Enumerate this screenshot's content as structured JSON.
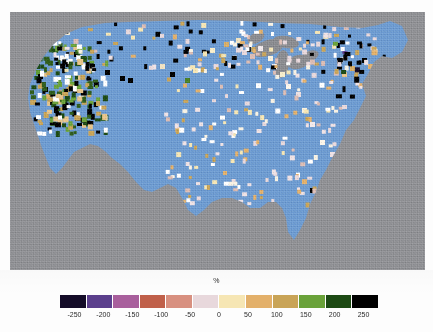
{
  "figure": {
    "kind": "choropleth-map-with-colorbar",
    "background_color": "#fdfdfd"
  },
  "map": {
    "title": "",
    "region": "Contiguous United States",
    "land_color": "#6d9bd1",
    "outside_color": "#8f9094",
    "panel": {
      "x": 10,
      "y": 12,
      "width": 415,
      "height": 258
    }
  },
  "colorbar": {
    "title": "%",
    "orientation": "horizontal",
    "vmin": -250,
    "vmax": 250,
    "tick_labels": [
      "-250",
      "-200",
      "-150",
      "-100",
      "-50",
      "0",
      "50",
      "100",
      "150",
      "200",
      "250"
    ],
    "tick_values": [
      -250,
      -200,
      -150,
      -100,
      -50,
      0,
      50,
      100,
      150,
      200,
      250
    ],
    "segment_colors": [
      "#140c28",
      "#5b3f8c",
      "#a85f9c",
      "#c0604a",
      "#d89080",
      "#e8d8dc",
      "#f6e6b4",
      "#e3b06a",
      "#c9a457",
      "#6aa23a",
      "#1d4a14",
      "#000000"
    ],
    "segment_labels": [
      "<= -250",
      "-250 to -200",
      "-200 to -150",
      "-150 to -100",
      "-100 to -50",
      "-50 to 0",
      "0 to 50",
      "50 to 100",
      "100 to 150",
      "150 to 200",
      "200 to 250",
      ">= 250"
    ]
  },
  "chart_data": {
    "type": "heatmap",
    "title": "",
    "xlabel": "",
    "ylabel": "",
    "colorbar_label": "%",
    "vmin": -250,
    "vmax": 250,
    "legend_position": "bottom",
    "grid": false,
    "cells": [
      {
        "x": 40,
        "y": 14,
        "value": 250,
        "color": "#000000"
      },
      {
        "x": 35,
        "y": 11,
        "value": 180,
        "color": "#2f5c1c"
      },
      {
        "x": 31,
        "y": 14,
        "value": 120,
        "color": "#c9a457"
      },
      {
        "x": 27,
        "y": 16,
        "value": 240,
        "color": "#0d2a0a"
      },
      {
        "x": 52,
        "y": 12,
        "value": 60,
        "color": "#efe2c0"
      },
      {
        "x": 55,
        "y": 18,
        "value": 30,
        "color": "#f6eed8"
      },
      {
        "x": 61,
        "y": 12,
        "value": 250,
        "color": "#000000"
      },
      {
        "x": 30,
        "y": 25,
        "value": 250,
        "color": "#000000"
      },
      {
        "x": 24,
        "y": 29,
        "value": 250,
        "color": "#000000"
      },
      {
        "x": 23,
        "y": 45,
        "value": 250,
        "color": "#000000"
      },
      {
        "x": 25,
        "y": 52,
        "value": 200,
        "color": "#1d4a14"
      },
      {
        "x": 26,
        "y": 58,
        "value": 160,
        "color": "#5d9a33"
      },
      {
        "x": 28,
        "y": 62,
        "value": 250,
        "color": "#000000"
      },
      {
        "x": 30,
        "y": 70,
        "value": 130,
        "color": "#c9a457"
      },
      {
        "x": 33,
        "y": 75,
        "value": 250,
        "color": "#000000"
      },
      {
        "x": 36,
        "y": 82,
        "value": 90,
        "color": "#e3b06a"
      },
      {
        "x": 40,
        "y": 88,
        "value": 250,
        "color": "#000000"
      },
      {
        "x": 44,
        "y": 96,
        "value": 250,
        "color": "#000000"
      },
      {
        "x": 64,
        "y": 40,
        "value": 250,
        "color": "#000000"
      },
      {
        "x": 72,
        "y": 45,
        "value": 180,
        "color": "#2f5c1c"
      },
      {
        "x": 80,
        "y": 52,
        "value": 250,
        "color": "#000000"
      },
      {
        "x": 95,
        "y": 58,
        "value": 250,
        "color": "#000000"
      },
      {
        "x": 110,
        "y": 64,
        "value": 250,
        "color": "#000000"
      },
      {
        "x": 118,
        "y": 66,
        "value": 250,
        "color": "#000000"
      },
      {
        "x": 150,
        "y": 52,
        "value": 70,
        "color": "#f0e2c2"
      },
      {
        "x": 160,
        "y": 60,
        "value": 250,
        "color": "#000000"
      },
      {
        "x": 175,
        "y": 66,
        "value": 170,
        "color": "#4a7f26"
      },
      {
        "x": 183,
        "y": 56,
        "value": 50,
        "color": "#f6e6b4"
      },
      {
        "x": 200,
        "y": 36,
        "value": 40,
        "color": "#f8eecb"
      },
      {
        "x": 214,
        "y": 30,
        "value": 110,
        "color": "#d9ae67"
      },
      {
        "x": 226,
        "y": 26,
        "value": 60,
        "color": "#efe2c0"
      },
      {
        "x": 232,
        "y": 38,
        "value": -40,
        "color": "#e8d8dc"
      },
      {
        "x": 240,
        "y": 42,
        "value": -60,
        "color": "#dcbcb4"
      },
      {
        "x": 248,
        "y": 34,
        "value": -20,
        "color": "#f2eaec"
      },
      {
        "x": 258,
        "y": 44,
        "value": 20,
        "color": "#faf2e0"
      },
      {
        "x": 262,
        "y": 52,
        "value": -10,
        "color": "#f6f0f2"
      },
      {
        "x": 270,
        "y": 60,
        "value": 30,
        "color": "#f8eecb"
      },
      {
        "x": 276,
        "y": 72,
        "value": 10,
        "color": "#fdf8ee"
      },
      {
        "x": 286,
        "y": 80,
        "value": -30,
        "color": "#ece0e2"
      },
      {
        "x": 292,
        "y": 96,
        "value": 20,
        "color": "#faf2e0"
      },
      {
        "x": 300,
        "y": 110,
        "value": -20,
        "color": "#f2eaec"
      },
      {
        "x": 310,
        "y": 128,
        "value": 15,
        "color": "#fcf6ea"
      },
      {
        "x": 320,
        "y": 140,
        "value": -25,
        "color": "#efe2e5"
      },
      {
        "x": 332,
        "y": 60,
        "value": 80,
        "color": "#e8c58a"
      },
      {
        "x": 340,
        "y": 54,
        "value": 110,
        "color": "#d9ae67"
      },
      {
        "x": 352,
        "y": 46,
        "value": 250,
        "color": "#000000"
      },
      {
        "x": 358,
        "y": 52,
        "value": 90,
        "color": "#e3b06a"
      },
      {
        "x": 364,
        "y": 58,
        "value": 250,
        "color": "#000000"
      },
      {
        "x": 300,
        "y": 176,
        "value": 250,
        "color": "#000000"
      },
      {
        "x": 186,
        "y": 208,
        "value": 250,
        "color": "#000000"
      }
    ]
  }
}
